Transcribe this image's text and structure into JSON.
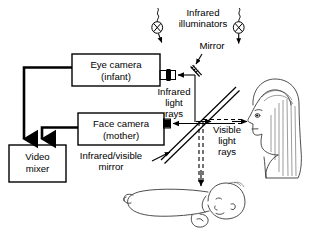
{
  "figure": {
    "background_color": "#ffffff",
    "line_color": "#000000",
    "width": 313,
    "height": 233
  },
  "boxes": [
    {
      "id": "eye-camera",
      "line1": "Eye camera",
      "line2": "(infant)"
    },
    {
      "id": "face-camera",
      "line1": "Face camera",
      "line2": "(mother)"
    },
    {
      "id": "video-mixer",
      "line1": "Video",
      "line2": "mixer"
    }
  ],
  "labels": {
    "infrared_illuminators_line1": "Infrared",
    "infrared_illuminators_line2": "illuminators",
    "mirror": "Mirror",
    "infrared_rays_line1": "Infrared",
    "infrared_rays_line2": "light",
    "infrared_rays_line3": "rays",
    "visible_rays_line1": "Visible",
    "visible_rays_line2": "light",
    "visible_rays_line3": "rays",
    "beamsplitter_line1": "Infrared/visible",
    "beamsplitter_line2": "mirror"
  },
  "components": {
    "illuminator_left": "infrared-illuminator-bulb-left",
    "illuminator_right": "infrared-illuminator-bulb-right",
    "mirror_small": "small-tilted-mirror",
    "beamsplitter": "infrared-visible-beamsplitter-mirror",
    "subject_mother": "mother-head-profile",
    "subject_infant": "infant-lying-figure",
    "lens_eye_camera": "eye-camera-lens",
    "lens_face_camera": "face-camera-lens"
  },
  "wires": {
    "eye_camera_to_mixer": "video-cable-eye-camera",
    "face_camera_to_mixer": "video-cable-face-camera"
  }
}
